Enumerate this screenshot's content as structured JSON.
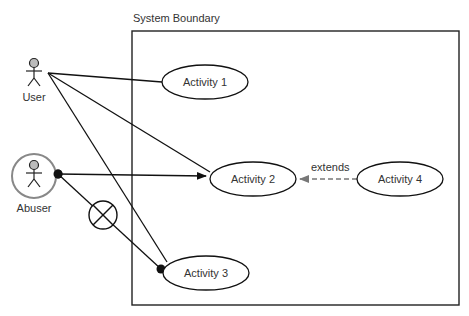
{
  "diagram": {
    "type": "use-case",
    "system_boundary": {
      "label": "System Boundary"
    },
    "actors": [
      {
        "id": "user",
        "label": "User"
      },
      {
        "id": "abuser",
        "label": "Abuser",
        "style": "circled"
      }
    ],
    "use_cases": [
      {
        "id": "a1",
        "label": "Activity 1"
      },
      {
        "id": "a2",
        "label": "Activity 2"
      },
      {
        "id": "a3",
        "label": "Activity 3"
      },
      {
        "id": "a4",
        "label": "Activity 4"
      }
    ],
    "relations": [
      {
        "from": "user",
        "to": "a1",
        "kind": "association"
      },
      {
        "from": "user",
        "to": "a2",
        "kind": "association"
      },
      {
        "from": "user",
        "to": "a3",
        "kind": "association"
      },
      {
        "from": "abuser",
        "to": "a2",
        "kind": "threatens",
        "arrow": "filled"
      },
      {
        "from": "abuser",
        "to": "a3",
        "kind": "threatens-mitigated",
        "marker": "crossed-circle"
      },
      {
        "from": "a4",
        "to": "a2",
        "kind": "extends",
        "label": "extends",
        "style": "dashed"
      }
    ],
    "colors": {
      "line": "#111111",
      "actor_head": "#bbbbbb",
      "abuser_ring": "#888888",
      "dashed": "#777777"
    }
  }
}
